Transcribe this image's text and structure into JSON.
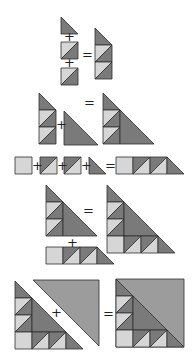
{
  "diagram": {
    "unit_px": 17,
    "colors": {
      "dark": "#7a7a7a",
      "light": "#d6d6d6",
      "medium": "#9c9c9c",
      "outline": "#2e2e2e",
      "background": "#ffffff"
    },
    "symbols": {
      "plus": "+",
      "equals": "="
    },
    "steps": [
      {
        "id": "step-1",
        "description": "Triangle + two half-square-triangle squares = three-unit column"
      },
      {
        "id": "step-2",
        "description": "Column + large triangle = stepped triangle"
      },
      {
        "id": "step-3",
        "description": "Light square + two half-square-triangle squares + small triangle = row"
      },
      {
        "id": "step-4",
        "description": "Stepped triangle + row = large pieced triangle"
      },
      {
        "id": "step-5",
        "description": "Pieced triangle + large medium triangle = completed square block"
      }
    ]
  }
}
